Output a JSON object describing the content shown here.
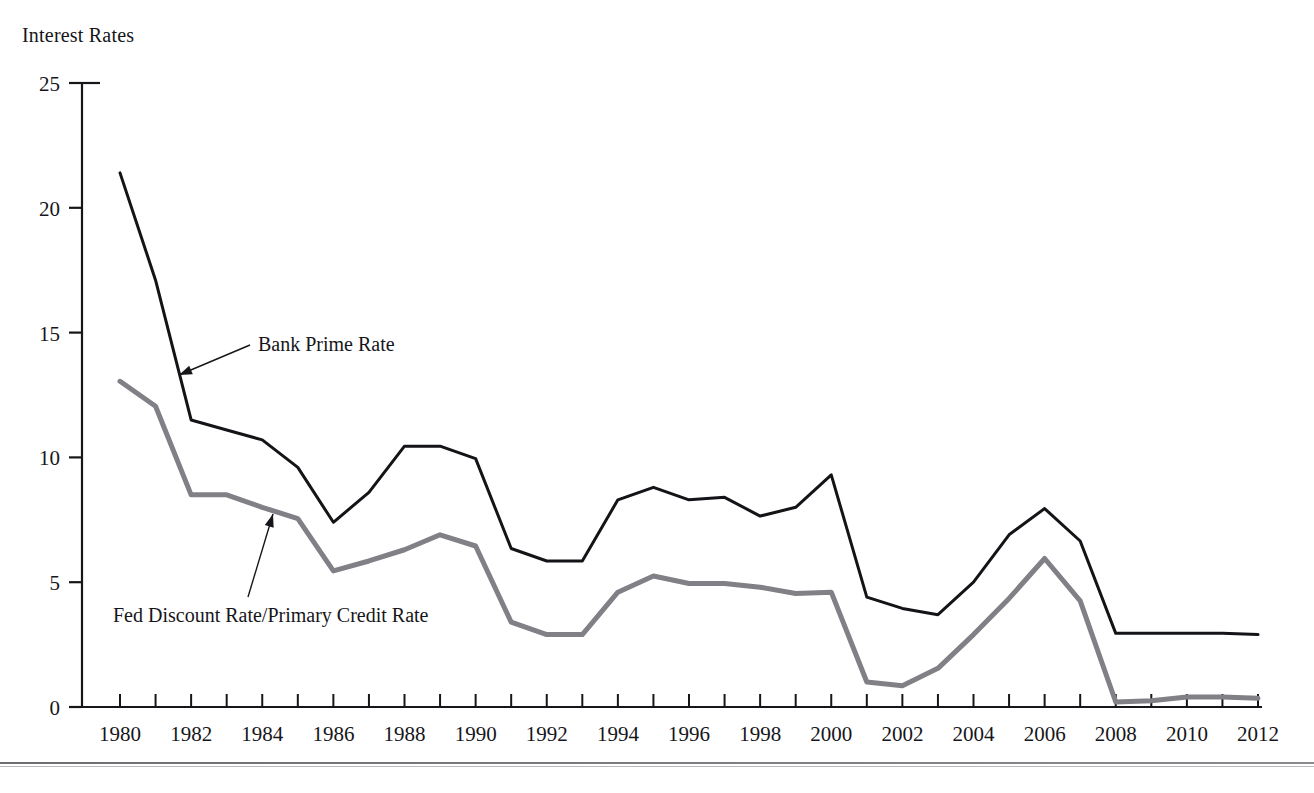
{
  "chart_data": {
    "type": "line",
    "title": "Interest Rates",
    "xlabel": "",
    "ylabel": "Interest Rates",
    "xlim": [
      1980,
      2012
    ],
    "ylim": [
      0,
      25
    ],
    "yticks": [
      0,
      5,
      10,
      15,
      20,
      25
    ],
    "ytick_labels": [
      "0",
      "5",
      "10",
      "15",
      "20",
      "25"
    ],
    "xticks": [
      1980,
      1981,
      1982,
      1983,
      1984,
      1985,
      1986,
      1987,
      1988,
      1989,
      1990,
      1991,
      1992,
      1993,
      1994,
      1995,
      1996,
      1997,
      1998,
      1999,
      2000,
      2001,
      2002,
      2003,
      2004,
      2005,
      2006,
      2007,
      2008,
      2009,
      2010,
      2011,
      2012
    ],
    "xtick_labels": [
      "1980",
      "",
      "1982",
      "",
      "1984",
      "",
      "1986",
      "",
      "1988",
      "",
      "1990",
      "",
      "1992",
      "",
      "1994",
      "",
      "1996",
      "",
      "1998",
      "",
      "2000",
      "",
      "2002",
      "",
      "2004",
      "",
      "2006",
      "",
      "2008",
      "",
      "2010",
      "",
      "2012"
    ],
    "xtick_labels_shown": [
      "1980",
      "1982",
      "1984",
      "1986",
      "1988",
      "1990",
      "1992",
      "1994",
      "1996",
      "1998",
      "2000",
      "2002",
      "2004",
      "2006",
      "2008",
      "2010",
      "2012"
    ],
    "grid": false,
    "legend": "annotations",
    "x": [
      1980,
      1981,
      1982,
      1983,
      1984,
      1985,
      1986,
      1987,
      1988,
      1989,
      1990,
      1991,
      1992,
      1993,
      1994,
      1995,
      1996,
      1997,
      1998,
      1999,
      2000,
      2001,
      2002,
      2003,
      2004,
      2005,
      2006,
      2007,
      2008,
      2009,
      2010,
      2011,
      2012
    ],
    "series": [
      {
        "name": "Bank Prime Rate",
        "color": "#141418",
        "width": 3,
        "values": [
          21.4,
          17.1,
          11.5,
          11.1,
          10.7,
          9.6,
          7.4,
          8.6,
          10.45,
          10.45,
          9.95,
          6.35,
          5.85,
          5.85,
          8.3,
          8.8,
          8.3,
          8.4,
          7.65,
          8.0,
          9.3,
          4.4,
          3.95,
          3.7,
          5.0,
          6.9,
          7.95,
          6.65,
          2.95,
          2.95,
          2.95,
          2.95,
          2.9
        ]
      },
      {
        "name": "Fed Discount Rate/Primary Credit Rate",
        "color": "#808086",
        "width": 5,
        "values": [
          13.05,
          12.05,
          8.5,
          8.5,
          8.0,
          7.55,
          5.45,
          5.85,
          6.3,
          6.9,
          6.45,
          3.4,
          2.9,
          2.9,
          4.6,
          5.25,
          4.95,
          4.95,
          4.8,
          4.55,
          4.6,
          1.0,
          0.85,
          1.55,
          2.9,
          4.35,
          5.95,
          4.25,
          0.2,
          0.25,
          0.4,
          0.4,
          0.35
        ]
      }
    ],
    "annotations": [
      {
        "label": "Bank Prime Rate",
        "text_x": 258,
        "text_y": 351,
        "arrow_from_x": 250,
        "arrow_from_y": 345,
        "arrow_to_x": 179,
        "arrow_to_y": 375
      },
      {
        "label": "Fed Discount Rate/Primary Credit Rate",
        "text_x": 113,
        "text_y": 622,
        "arrow_from_x": 248,
        "arrow_from_y": 597,
        "arrow_to_x": 273,
        "arrow_to_y": 514
      }
    ]
  }
}
